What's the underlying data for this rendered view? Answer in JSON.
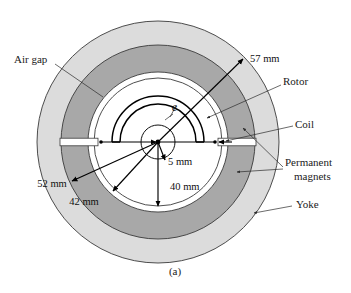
{
  "figure": {
    "caption": "(a)",
    "center": {
      "x": 158,
      "y": 142
    },
    "colors": {
      "yoke_fill": "#dcdcdc",
      "magnet_fill": "#a8a8a8",
      "air_gap_fill": "#ffffff",
      "interior_fill": "#ffffff",
      "outline": "#3a3a3a",
      "ink": "#111111"
    },
    "radii": {
      "outer_yoke": 121,
      "magnet_outer": 97,
      "magnet_inner": 70,
      "air_gap_inner": 64,
      "rotor_outer": 46,
      "rotor_inner": 38,
      "hub": 17
    }
  },
  "labels": [
    {
      "id": "air-gap",
      "text": "Air gap",
      "text_x": 14,
      "text_y": 60,
      "anchor": "start",
      "leader": "M 55 64 L 103 97",
      "arrow": false
    },
    {
      "id": "rotor",
      "text": "Rotor",
      "text_x": 283,
      "text_y": 82,
      "anchor": "start",
      "leader": "M 281 85 L 207 118",
      "arrow": true
    },
    {
      "id": "coil",
      "text": "Coil",
      "text_x": 295,
      "text_y": 125,
      "anchor": "start",
      "leader": "M 293 126 L 226 141",
      "arrow": true
    },
    {
      "id": "permanent-magnets-line1",
      "text": "Permanent",
      "text_x": 285,
      "text_y": 163,
      "anchor": "start",
      "leader": "M 283 167 L 243 128",
      "arrow": true
    },
    {
      "id": "permanent-magnets-line2",
      "text": "magnets",
      "text_x": 294,
      "text_y": 177,
      "anchor": "start",
      "leader": "M 283 169 L 237 172",
      "arrow": true
    },
    {
      "id": "yoke",
      "text": "Yoke",
      "text_x": 296,
      "text_y": 205,
      "anchor": "start",
      "leader": "M 292 206 L 254 213",
      "arrow": true
    }
  ],
  "dimensions": [
    {
      "id": "dim-57mm",
      "text": "57 mm",
      "text_x": 250,
      "text_y": 60,
      "anchor": "start",
      "line": "M 158 142 L 243 59",
      "arrow_at": "end"
    },
    {
      "id": "dim-52mm",
      "text": "52 mm",
      "text_x": 52,
      "text_y": 185,
      "anchor": "middle",
      "line": "M 158 142 L 72 181",
      "arrow_at": "end"
    },
    {
      "id": "dim-42mm",
      "text": "42 mm",
      "text_x": 84,
      "text_y": 203,
      "anchor": "middle",
      "line": "M 158 142 L 113 191",
      "arrow_at": "end"
    },
    {
      "id": "dim-40mm",
      "text": "40 mm",
      "text_x": 170,
      "text_y": 188,
      "anchor": "start",
      "line": "M 158 142 L 158 206",
      "arrow_at": "end"
    },
    {
      "id": "dim-5mm",
      "text": "5 mm",
      "text_x": 168,
      "text_y": 163,
      "anchor": "start",
      "line": "M 158 142 L 164 159",
      "arrow_at": "end"
    },
    {
      "id": "dim-coil-left",
      "text": "",
      "line": "M 100 142 L 157 142",
      "arrow_at": "both"
    },
    {
      "id": "dim-coil-right",
      "text": "",
      "line": "M 160 142 L 216 142",
      "arrow_at": "both"
    }
  ],
  "symbols": [
    {
      "id": "thickness-e",
      "text": "e",
      "text_x": 172,
      "text_y": 110
    }
  ]
}
